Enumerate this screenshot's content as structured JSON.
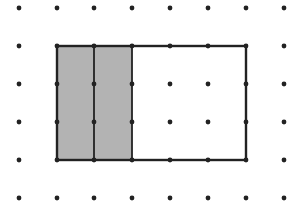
{
  "diagram": {
    "type": "dot-grid-rectangle",
    "grid": {
      "x": [
        19,
        57,
        94,
        132,
        170,
        208,
        246,
        284
      ],
      "y": [
        8,
        46,
        84,
        122,
        160,
        198
      ],
      "dot_radius": 2.4,
      "dot_color": "#222222"
    },
    "rectangle": {
      "x1": 57,
      "y1": 46,
      "x2": 246,
      "y2": 160,
      "columns": 5,
      "rows": 3,
      "stroke": "#222222"
    },
    "shaded": {
      "x1": 57,
      "x2": 132,
      "y1": 46,
      "y2": 160,
      "fill": "#b3b3b3",
      "divider_x": 94,
      "columns_shaded": 2
    }
  }
}
